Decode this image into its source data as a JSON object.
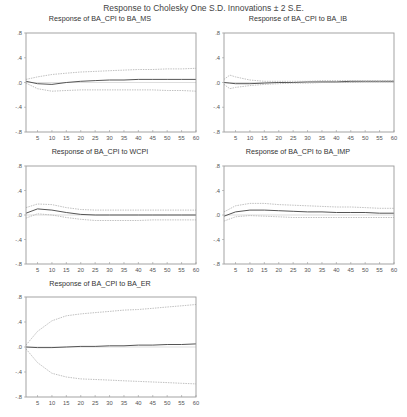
{
  "page": {
    "title": "Response to Cholesky One S.D. Innovations ± 2 S.E."
  },
  "panels": [
    {
      "title": "Response of BA_CPI to BA_MS"
    },
    {
      "title": "Response of BA_CPI to BA_IB"
    },
    {
      "title": "Response of BA_CPI to WCPI"
    },
    {
      "title": "Response of BA_CPI to BA_IMP"
    },
    {
      "title": "Response of BA_CPI to BA_ER"
    }
  ],
  "axes": {
    "y_ticks": [
      ".8",
      ".4",
      ".0",
      "-.4",
      "-.8"
    ],
    "x_ticks": [
      "5",
      "10",
      "15",
      "20",
      "25",
      "30",
      "35",
      "40",
      "45",
      "50",
      "55",
      "60"
    ]
  },
  "chart_data": [
    {
      "type": "line",
      "title": "Response of BA_CPI to BA_MS",
      "xlabel": "",
      "ylabel": "",
      "xlim": [
        1,
        60
      ],
      "ylim": [
        -0.8,
        0.8
      ],
      "grid": false,
      "x": [
        1,
        5,
        10,
        15,
        20,
        25,
        30,
        35,
        40,
        45,
        50,
        55,
        60
      ],
      "series": [
        {
          "name": "Response",
          "values": [
            0.02,
            -0.02,
            -0.03,
            0.0,
            0.02,
            0.03,
            0.04,
            0.04,
            0.05,
            0.05,
            0.05,
            0.05,
            0.05
          ]
        },
        {
          "name": "+2 S.E.",
          "values": [
            0.05,
            0.09,
            0.13,
            0.15,
            0.17,
            0.18,
            0.19,
            0.2,
            0.21,
            0.21,
            0.22,
            0.22,
            0.23
          ]
        },
        {
          "name": "-2 S.E.",
          "values": [
            -0.01,
            -0.1,
            -0.14,
            -0.13,
            -0.12,
            -0.12,
            -0.12,
            -0.12,
            -0.12,
            -0.12,
            -0.13,
            -0.13,
            -0.14
          ]
        }
      ]
    },
    {
      "type": "line",
      "title": "Response of BA_CPI to BA_IB",
      "xlabel": "",
      "ylabel": "",
      "xlim": [
        1,
        60
      ],
      "ylim": [
        -0.8,
        0.8
      ],
      "grid": false,
      "x": [
        1,
        3,
        5,
        10,
        15,
        20,
        25,
        30,
        35,
        40,
        45,
        50,
        55,
        60
      ],
      "series": [
        {
          "name": "Response",
          "values": [
            0.0,
            -0.01,
            -0.02,
            -0.02,
            -0.01,
            0.0,
            0.0,
            0.01,
            0.01,
            0.01,
            0.02,
            0.02,
            0.02,
            0.02
          ]
        },
        {
          "name": "+2 S.E.",
          "values": [
            0.05,
            0.12,
            0.09,
            0.04,
            0.02,
            0.02,
            0.02,
            0.02,
            0.03,
            0.03,
            0.03,
            0.03,
            0.03,
            0.03
          ]
        },
        {
          "name": "-2 S.E.",
          "values": [
            -0.03,
            -0.1,
            -0.08,
            -0.05,
            -0.03,
            -0.02,
            -0.01,
            -0.01,
            0.0,
            0.0,
            0.0,
            0.01,
            0.01,
            0.01
          ]
        }
      ]
    },
    {
      "type": "line",
      "title": "Response of BA_CPI to WCPI",
      "xlabel": "",
      "ylabel": "",
      "xlim": [
        1,
        60
      ],
      "ylim": [
        -0.8,
        0.8
      ],
      "grid": false,
      "x": [
        1,
        5,
        10,
        15,
        20,
        25,
        30,
        35,
        40,
        45,
        50,
        55,
        60
      ],
      "series": [
        {
          "name": "Response",
          "values": [
            0.03,
            0.1,
            0.08,
            0.04,
            0.01,
            0.0,
            0.0,
            0.0,
            0.0,
            0.0,
            0.0,
            0.0,
            0.0
          ]
        },
        {
          "name": "+2 S.E.",
          "values": [
            0.12,
            0.18,
            0.17,
            0.12,
            0.09,
            0.08,
            0.08,
            0.08,
            0.08,
            0.08,
            0.08,
            0.08,
            0.08
          ]
        },
        {
          "name": "-2 S.E.",
          "values": [
            -0.05,
            0.02,
            0.0,
            -0.04,
            -0.07,
            -0.09,
            -0.09,
            -0.09,
            -0.09,
            -0.08,
            -0.08,
            -0.08,
            -0.08
          ]
        }
      ]
    },
    {
      "type": "line",
      "title": "Response of BA_CPI to BA_IMP",
      "xlabel": "",
      "ylabel": "",
      "xlim": [
        1,
        60
      ],
      "ylim": [
        -0.8,
        0.8
      ],
      "grid": false,
      "x": [
        1,
        5,
        10,
        15,
        20,
        25,
        30,
        35,
        40,
        45,
        50,
        55,
        60
      ],
      "series": [
        {
          "name": "Response",
          "values": [
            -0.02,
            0.05,
            0.08,
            0.08,
            0.07,
            0.06,
            0.05,
            0.05,
            0.04,
            0.04,
            0.04,
            0.03,
            0.03
          ]
        },
        {
          "name": "+2 S.E.",
          "values": [
            0.05,
            0.15,
            0.19,
            0.19,
            0.17,
            0.16,
            0.15,
            0.14,
            0.13,
            0.13,
            0.12,
            0.11,
            0.11
          ]
        },
        {
          "name": "-2 S.E.",
          "values": [
            -0.1,
            -0.03,
            -0.01,
            -0.02,
            -0.03,
            -0.04,
            -0.04,
            -0.04,
            -0.04,
            -0.04,
            -0.04,
            -0.04,
            -0.04
          ]
        }
      ]
    },
    {
      "type": "line",
      "title": "Response of BA_CPI to BA_ER",
      "xlabel": "",
      "ylabel": "",
      "xlim": [
        1,
        60
      ],
      "ylim": [
        -0.8,
        0.8
      ],
      "grid": false,
      "x": [
        1,
        5,
        10,
        15,
        20,
        25,
        30,
        35,
        40,
        45,
        50,
        55,
        60
      ],
      "series": [
        {
          "name": "Response",
          "values": [
            0.0,
            -0.01,
            -0.01,
            0.0,
            0.01,
            0.01,
            0.02,
            0.02,
            0.03,
            0.03,
            0.04,
            0.04,
            0.05
          ]
        },
        {
          "name": "+2 S.E.",
          "values": [
            0.03,
            0.25,
            0.42,
            0.5,
            0.53,
            0.55,
            0.57,
            0.59,
            0.6,
            0.62,
            0.64,
            0.66,
            0.68
          ]
        },
        {
          "name": "-2 S.E.",
          "values": [
            -0.03,
            -0.25,
            -0.42,
            -0.48,
            -0.51,
            -0.52,
            -0.53,
            -0.54,
            -0.55,
            -0.56,
            -0.57,
            -0.58,
            -0.59
          ]
        }
      ]
    }
  ]
}
